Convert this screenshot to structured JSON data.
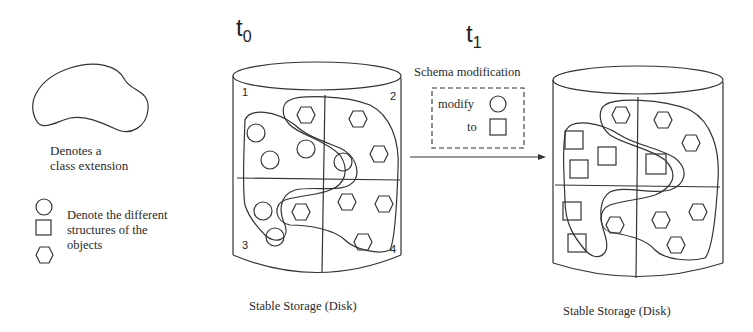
{
  "legend": {
    "class_extension_label_line1": "Denotes a",
    "class_extension_label_line2": "class extension",
    "structures_label_line1": "Denote the different",
    "structures_label_line2": "structures of the",
    "structures_label_line3": "objects",
    "shapes": [
      "circle",
      "square",
      "hexagon"
    ]
  },
  "time_labels": {
    "t0": {
      "base": "t",
      "sub": "0"
    },
    "t1": {
      "base": "t",
      "sub": "1"
    }
  },
  "transition": {
    "title": "Schema modification",
    "modify_label": "modify",
    "to_label": "to",
    "from_shape": "circle",
    "to_shape": "square"
  },
  "disks": [
    {
      "id": "disk-t0",
      "caption": "Stable Storage (Disk)",
      "quadrant_labels": [
        "1",
        "2",
        "3",
        "4"
      ],
      "object_shape_left": "circle",
      "object_shape_right": "hexagon"
    },
    {
      "id": "disk-t1",
      "caption": "Stable Storage (Disk)",
      "quadrant_labels": [],
      "object_shape_left": "square",
      "object_shape_right": "hexagon"
    }
  ]
}
